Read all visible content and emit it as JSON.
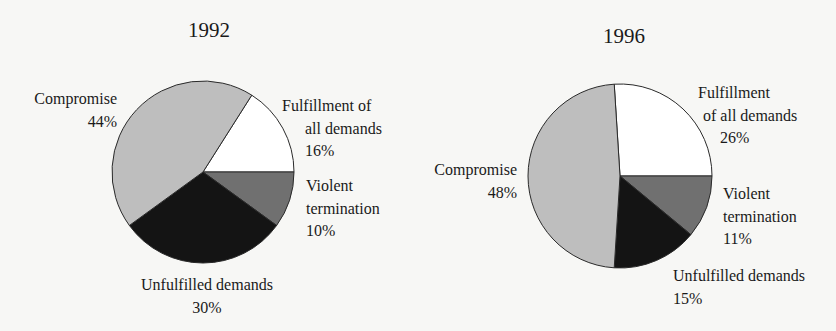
{
  "chart_data": [
    {
      "type": "pie",
      "title": "1992",
      "center": [
        203,
        172
      ],
      "radius": 91,
      "slices": [
        {
          "label": "Fulfillment of all demands",
          "value": 16,
          "color": "#ffffff"
        },
        {
          "label": "Violent termination",
          "value": 10,
          "color": "#707070"
        },
        {
          "label": "Unfulfilled demands",
          "value": 30,
          "color": "#141414"
        },
        {
          "label": "Compromise",
          "value": 44,
          "color": "#bebebe"
        }
      ]
    },
    {
      "type": "pie",
      "title": "1996",
      "center": [
        620,
        176
      ],
      "radius": 92,
      "slices": [
        {
          "label": "Fulfillment of all demands",
          "value": 26,
          "color": "#ffffff"
        },
        {
          "label": "Violent termination",
          "value": 11,
          "color": "#707070"
        },
        {
          "label": "Unfulfilled demands",
          "value": 15,
          "color": "#141414"
        },
        {
          "label": "Compromise",
          "value": 48,
          "color": "#bebebe"
        }
      ]
    }
  ],
  "charts": {
    "c1992": {
      "title": "1992",
      "compromise": {
        "line1": "Compromise",
        "pct": "44%"
      },
      "fulfillment": {
        "line1": "Fulfillment of",
        "line2": "all demands",
        "pct": "16%"
      },
      "violent": {
        "line1": "Violent",
        "line2": "termination",
        "pct": "10%"
      },
      "unfulfilled": {
        "line1": "Unfulfilled demands",
        "pct": "30%"
      }
    },
    "c1996": {
      "title": "1996",
      "compromise": {
        "line1": "Compromise",
        "pct": "48%"
      },
      "fulfillment": {
        "line1": "Fulfillment",
        "line2": "of all demands",
        "pct": "26%"
      },
      "violent": {
        "line1": "Violent",
        "line2": "termination",
        "pct": "11%"
      },
      "unfulfilled": {
        "line1": "Unfulfilled demands",
        "pct": "15%"
      }
    }
  }
}
